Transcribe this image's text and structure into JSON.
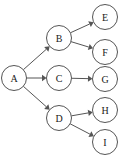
{
  "diagram": {
    "type": "directed-graph",
    "title": "",
    "background_color": "#ffffff",
    "node_fill_color": "#ffffff",
    "node_stroke_color": "#555555",
    "edge_color": "#555555",
    "label_color": "#1a1a1a",
    "node_radius": 12.5,
    "nodes": [
      {
        "id": "A",
        "label": "A",
        "cx": 14,
        "cy": 78
      },
      {
        "id": "B",
        "label": "B",
        "cx": 59,
        "cy": 38
      },
      {
        "id": "C",
        "label": "C",
        "cx": 59,
        "cy": 78
      },
      {
        "id": "D",
        "label": "D",
        "cx": 59,
        "cy": 118
      },
      {
        "id": "E",
        "label": "E",
        "cx": 105,
        "cy": 17
      },
      {
        "id": "F",
        "label": "F",
        "cx": 105,
        "cy": 52
      },
      {
        "id": "G",
        "label": "G",
        "cx": 105,
        "cy": 79
      },
      {
        "id": "H",
        "label": "H",
        "cx": 105,
        "cy": 110
      },
      {
        "id": "I",
        "label": "I",
        "cx": 105,
        "cy": 142
      }
    ],
    "edges": [
      {
        "id": "A-B",
        "from": "A",
        "to": "B",
        "directed": true
      },
      {
        "id": "A-C",
        "from": "A",
        "to": "C",
        "directed": true
      },
      {
        "id": "A-D",
        "from": "A",
        "to": "D",
        "directed": true
      },
      {
        "id": "B-E",
        "from": "B",
        "to": "E",
        "directed": true
      },
      {
        "id": "B-F",
        "from": "B",
        "to": "F",
        "directed": true
      },
      {
        "id": "C-G",
        "from": "C",
        "to": "G",
        "directed": true
      },
      {
        "id": "D-H",
        "from": "D",
        "to": "H",
        "directed": true
      },
      {
        "id": "D-I",
        "from": "D",
        "to": "I",
        "directed": true
      }
    ]
  }
}
